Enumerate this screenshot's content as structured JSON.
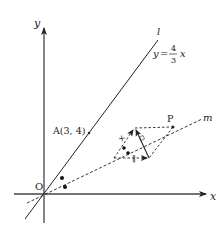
{
  "diagram": {
    "axes": {
      "x_label": "x",
      "y_label": "y",
      "origin_label": "O"
    },
    "line_l": {
      "label": "l",
      "equation_lhs": "y",
      "equation_eq": "=",
      "equation_num": "4",
      "equation_den": "3",
      "equation_var": "x"
    },
    "point_a": {
      "label": "A(3, 4)"
    },
    "line_m": {
      "label": "m"
    },
    "point_p": {
      "label": "P"
    },
    "marks": {
      "cross": "×",
      "parallel": "‖"
    },
    "colors": {
      "stroke": "#222222",
      "background": "#ffffff"
    }
  }
}
